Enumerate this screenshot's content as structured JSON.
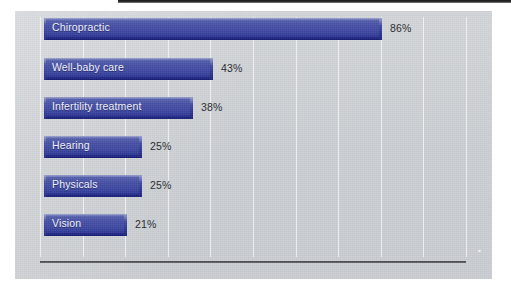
{
  "chart_data": {
    "type": "bar",
    "orientation": "horizontal",
    "title": "",
    "subtitle": "",
    "xlabel": "",
    "ylabel": "",
    "categories": [
      "Chiropractic",
      "Well-baby care",
      "Infertility treatment",
      "Hearing",
      "Physicals",
      "Vision"
    ],
    "values": [
      86,
      43,
      38,
      25,
      25,
      21
    ],
    "value_labels": [
      "86%",
      "43%",
      "38%",
      "25%",
      "25%",
      "21%"
    ],
    "xlim": [
      0,
      100
    ],
    "ylim": null,
    "grid": true,
    "grid_axis": "x",
    "gridline_count": 11,
    "legend": null,
    "legend_position": "none",
    "annotations": [],
    "colors": {
      "bar_fill": "#3b45a0",
      "bar_highlight": "#8f96c9",
      "bar_shadow": "#141a6e",
      "panel_background": "#cdd0d4",
      "gridline": "#ffffff",
      "axis_line": "#3e4043",
      "bar_label_text": "#eef0f7",
      "value_label_text": "#25272b"
    }
  },
  "bars": [
    {
      "label": "Chiropractic",
      "value": 86,
      "value_label": "86%"
    },
    {
      "label": "Well-baby care",
      "value": 43,
      "value_label": "43%"
    },
    {
      "label": "Infertility treatment",
      "value": 38,
      "value_label": "38%"
    },
    {
      "label": "Hearing",
      "value": 25,
      "value_label": "25%"
    },
    {
      "label": "Physicals",
      "value": 25,
      "value_label": "25%"
    },
    {
      "label": "Vision",
      "value": 21,
      "value_label": "21%"
    }
  ]
}
